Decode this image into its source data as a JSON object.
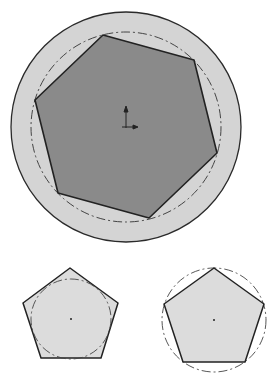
{
  "figure": {
    "colors": {
      "outer_fill": "#d4d4d4",
      "hexagon_fill": "#8a8a8a",
      "pentagon_fill": "#dcdcdc",
      "stroke": "#2a2a2a",
      "construction": "#444444"
    },
    "shapes": [
      {
        "name": "outer-circle",
        "cx": 126,
        "cy": 127,
        "r": 115
      },
      {
        "name": "hexagon",
        "points": "103,35 194,60 217,153 149,218 58,193 35,100"
      },
      {
        "name": "hexagon-construction-circle",
        "cx": 126,
        "cy": 127,
        "r": 95,
        "style": "dash-dot"
      },
      {
        "name": "pentagon-circumscribed",
        "points": "70,268 118,303 101,358 41,358 23,303",
        "center": [
          71,
          319
        ]
      },
      {
        "name": "pentagon-incircle",
        "cx": 71,
        "cy": 319,
        "r": 40,
        "style": "dash-dot"
      },
      {
        "name": "pentagon-inscribed",
        "points": "214,268 264,304 245,362 183,362 164,304",
        "center": [
          214,
          320
        ]
      },
      {
        "name": "pentagon-circumcircle",
        "cx": 214,
        "cy": 320,
        "r": 52,
        "style": "dash-dot"
      }
    ]
  }
}
